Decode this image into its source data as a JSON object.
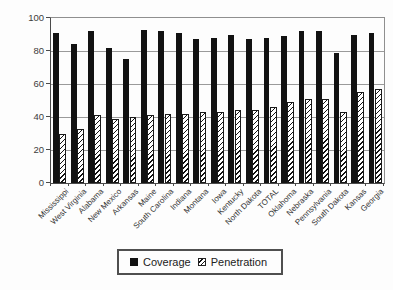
{
  "chart_data": {
    "type": "bar",
    "title": "",
    "xlabel": "",
    "ylabel": "",
    "categories": [
      "Mississippi",
      "West Virginia",
      "Alabama",
      "New Mexico",
      "Arkansas",
      "Maine",
      "South Carolina",
      "Indiana",
      "Montana",
      "Iowa",
      "Kentucky",
      "North Dakota",
      "TOTAL",
      "Oklahoma",
      "Nebraska",
      "Pennsylvania",
      "South Dakota",
      "Kansas",
      "Georgia"
    ],
    "series": [
      {
        "name": "Coverage",
        "style": "solid-black",
        "values": [
          91,
          84,
          92,
          82,
          75,
          93,
          92,
          91,
          87,
          88,
          90,
          87,
          88,
          89,
          92,
          92,
          79,
          90,
          91
        ]
      },
      {
        "name": "Penetration",
        "style": "diagonal-hatch",
        "values": [
          30,
          33,
          41,
          39,
          40,
          41,
          42,
          42,
          43,
          43,
          44,
          44,
          46,
          49,
          51,
          51,
          43,
          55,
          57
        ]
      }
    ],
    "ylim": [
      0,
      100
    ],
    "yticks": [
      0,
      20,
      40,
      60,
      80,
      100
    ],
    "grid": true,
    "legend_position": "bottom",
    "colors": {
      "bar_fill": "#121212",
      "hatch_stroke": "#121212",
      "hatch_bg": "#ffffff",
      "gridline": "#9a9a9a",
      "axis": "#4a4a4a",
      "text": "#333333",
      "background": "#fdfdfd",
      "legend_border": "#4f4f4f"
    }
  }
}
